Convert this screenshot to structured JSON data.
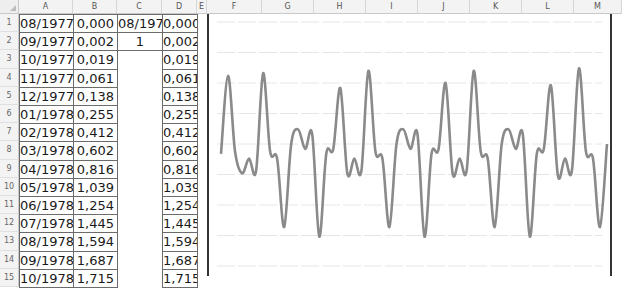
{
  "spreadsheet": {
    "columns": [
      "A",
      "B",
      "C",
      "D",
      "E",
      "F",
      "G",
      "H",
      "I",
      "J",
      "K",
      "L",
      "M"
    ],
    "rows": [
      {
        "n": "1",
        "A": "08/1977",
        "B": "0,000",
        "C": "08/1977",
        "D": "0,000"
      },
      {
        "n": "2",
        "A": "09/1977",
        "B": "0,002",
        "C": "1",
        "D": "0,002"
      },
      {
        "n": "3",
        "A": "10/1977",
        "B": "0,019",
        "C": "",
        "D": "0,019"
      },
      {
        "n": "4",
        "A": "11/1977",
        "B": "0,061",
        "C": "",
        "D": "0,061"
      },
      {
        "n": "5",
        "A": "12/1977",
        "B": "0,138",
        "C": "",
        "D": "0,138"
      },
      {
        "n": "6",
        "A": "01/1978",
        "B": "0,255",
        "C": "",
        "D": "0,255"
      },
      {
        "n": "7",
        "A": "02/1978",
        "B": "0,412",
        "C": "",
        "D": "0,412"
      },
      {
        "n": "8",
        "A": "03/1978",
        "B": "0,602",
        "C": "",
        "D": "0,602"
      },
      {
        "n": "9",
        "A": "04/1978",
        "B": "0,816",
        "C": "",
        "D": "0,816"
      },
      {
        "n": "10",
        "A": "05/1978",
        "B": "1,039",
        "C": "",
        "D": "1,039"
      },
      {
        "n": "11",
        "A": "06/1978",
        "B": "1,254",
        "C": "",
        "D": "1,254"
      },
      {
        "n": "12",
        "A": "07/1978",
        "B": "1,445",
        "C": "",
        "D": "1,445"
      },
      {
        "n": "13",
        "A": "08/1978",
        "B": "1,594",
        "C": "",
        "D": "1,594"
      },
      {
        "n": "14",
        "A": "09/1978",
        "B": "1,687",
        "C": "",
        "D": "1,687"
      },
      {
        "n": "15",
        "A": "10/1978",
        "B": "1,715",
        "C": "",
        "D": "1,715"
      }
    ]
  },
  "chart": {
    "line_color": "#8a8a8a",
    "gridline_color": "#e6e6e6",
    "gridlines": 8
  },
  "chart_data": {
    "type": "line",
    "title": "",
    "xlabel": "",
    "ylabel": "",
    "grid": true,
    "legend": "none",
    "note": "Periodic oscillating waveform; values approximate, read in relative units (0 = bottom, 10 = top of plot area)",
    "series": [
      {
        "name": "Series1",
        "values": [
          4.6,
          7.8,
          4.7,
          3.8,
          4.4,
          3.9,
          7.9,
          4.7,
          4.4,
          1.6,
          5.0,
          5.6,
          4.8,
          5.4,
          1.2,
          4.6,
          4.8,
          7.3,
          3.8,
          4.4,
          3.9,
          8.0,
          4.7,
          4.4,
          1.6,
          5.0,
          5.6,
          4.8,
          5.4,
          1.2,
          4.6,
          4.8,
          7.5,
          3.8,
          4.4,
          3.9,
          8.0,
          4.7,
          4.4,
          1.6,
          5.0,
          5.6,
          4.8,
          5.4,
          1.2,
          4.6,
          4.8,
          7.4,
          3.7,
          4.4,
          3.9,
          8.1,
          4.7,
          4.4,
          1.6,
          5.0
        ]
      }
    ]
  }
}
